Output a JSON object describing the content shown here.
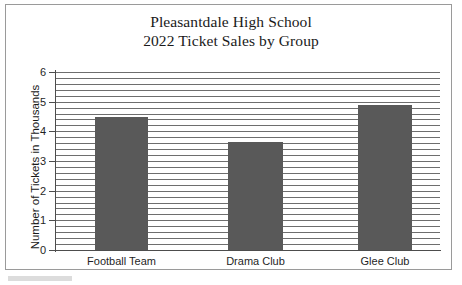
{
  "chart_data": {
    "type": "bar",
    "title": "Pleasantdale High School\n2022 Ticket Sales by Group",
    "title_lines": [
      "Pleasantdale High School",
      "2022 Ticket Sales by Group"
    ],
    "categories": [
      "Football Team",
      "Drama Club",
      "Glee Club"
    ],
    "values": [
      4.5,
      3.65,
      4.9
    ],
    "xlabel": "",
    "ylabel": "Number of Tickets in Thousands",
    "ylim": [
      0,
      6
    ],
    "ytick_labels": [
      "6",
      "5",
      "4",
      "3",
      "2",
      "1",
      "0"
    ],
    "ytick_values": [
      6,
      5,
      4,
      3,
      2,
      1,
      0
    ],
    "y_major_step": 1,
    "y_minor_step": 0.2,
    "grid": "horizontal-minor-and-major",
    "legend": "none",
    "bar_color": "#595959",
    "grid_color": "#6e6e6e",
    "axis_color": "#4d4d4d",
    "background_color": "#ffffff",
    "frame_border_color": "#9a9a9a",
    "bars": [
      {
        "category": "Football Team",
        "value": 4.5
      },
      {
        "category": "Drama Club",
        "value": 3.65
      },
      {
        "category": "Glee Club",
        "value": 4.9
      }
    ]
  }
}
